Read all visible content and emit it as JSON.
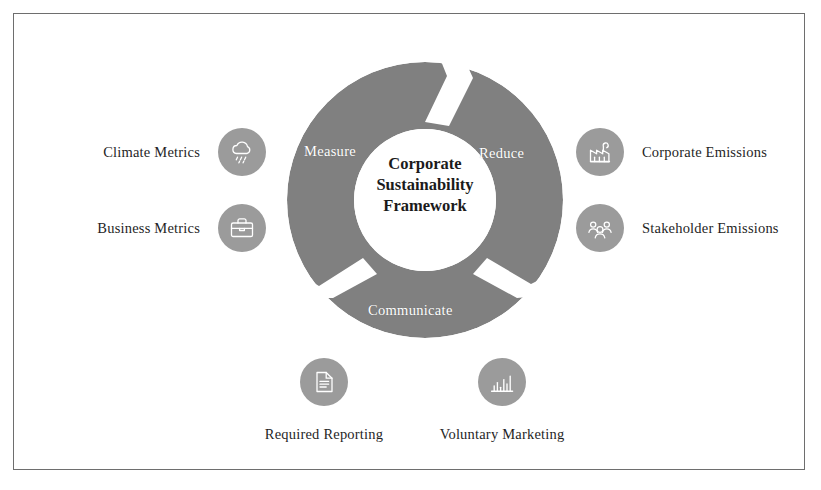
{
  "diagram": {
    "center": {
      "lines": [
        "Corporate",
        "Sustainability",
        "Framework"
      ]
    },
    "segments": [
      {
        "id": "measure",
        "label": "Measure"
      },
      {
        "id": "reduce",
        "label": "Reduce"
      },
      {
        "id": "communicate",
        "label": "Communicate"
      }
    ],
    "nodes": [
      {
        "id": "climate-metrics",
        "label": "Climate Metrics",
        "icon": "cloud-rain-icon",
        "side": "left"
      },
      {
        "id": "business-metrics",
        "label": "Business Metrics",
        "icon": "briefcase-icon",
        "side": "left"
      },
      {
        "id": "corporate-emissions",
        "label": "Corporate Emissions",
        "icon": "factory-icon",
        "side": "right"
      },
      {
        "id": "stakeholder-emissions",
        "label": "Stakeholder Emissions",
        "icon": "people-group-icon",
        "side": "right"
      },
      {
        "id": "required-reporting",
        "label": "Required Reporting",
        "icon": "document-icon",
        "side": "below"
      },
      {
        "id": "voluntary-marketing",
        "label": "Voluntary Marketing",
        "icon": "bar-chart-icon",
        "side": "below"
      }
    ]
  },
  "colors": {
    "ring": "#808080",
    "badge": "#9b9b9b",
    "icon_stroke": "#ffffff",
    "segment_label": "#ffffff",
    "center_text": "#1b1b1b",
    "node_label": "#1f1f1f",
    "frame_border": "#6e6e6e",
    "background": "#ffffff"
  }
}
